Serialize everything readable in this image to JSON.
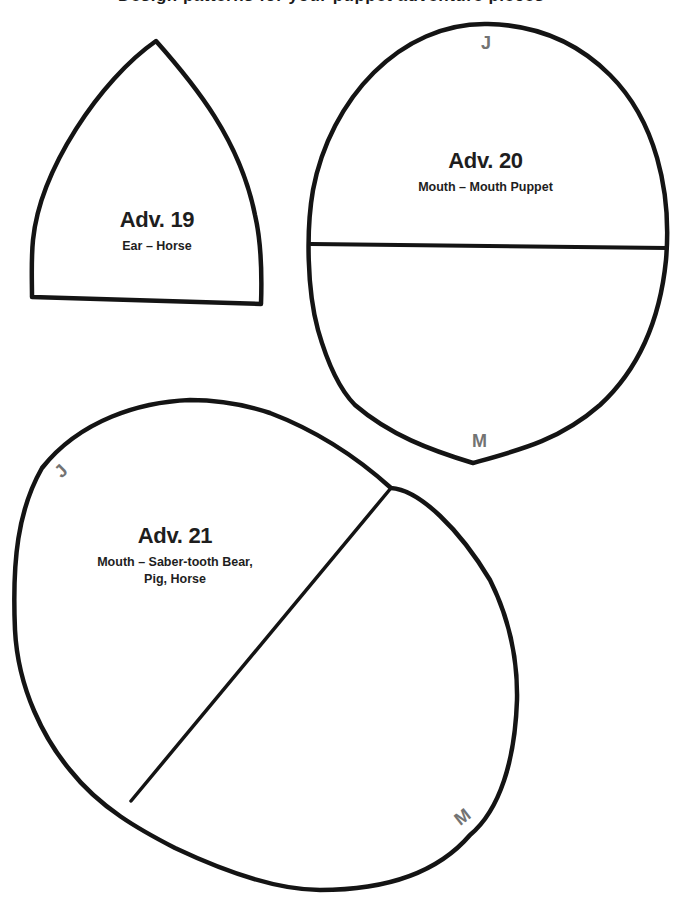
{
  "page": {
    "clipped_header_text": "Design patterns for your puppet adventure pieces"
  },
  "pieces": [
    {
      "id": "adv19",
      "title": "Adv. 19",
      "subtitle": "Ear – Horse",
      "shape": "pointed-arch"
    },
    {
      "id": "adv20",
      "title": "Adv. 20",
      "subtitle": "Mouth – Mouth Puppet",
      "shape": "oval-with-horizontal-fold",
      "markers": {
        "top": "J",
        "bottom": "M"
      }
    },
    {
      "id": "adv21",
      "title": "Adv. 21",
      "subtitle_line1": "Mouth – Saber-tooth Bear,",
      "subtitle_line2": "Pig, Horse",
      "shape": "tilted-oval-with-diagonal-fold",
      "markers": {
        "top": "J",
        "bottom": "M"
      }
    }
  ],
  "colors": {
    "outline": "#141414",
    "text": "#1e1e1e",
    "marker": "#737373",
    "background": "#ffffff"
  }
}
